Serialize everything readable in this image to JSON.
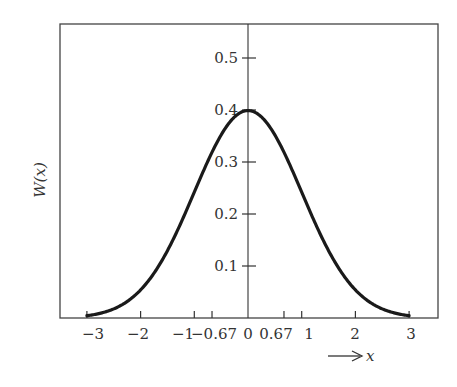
{
  "chart_data": {
    "type": "line",
    "title": "",
    "xlabel": "x",
    "ylabel": "W(x)",
    "xlim": [
      -3.5,
      3.5
    ],
    "ylim": [
      0,
      0.55
    ],
    "grid": false,
    "legend": null,
    "x_ticks": [
      -3,
      -2,
      -1,
      -0.67,
      0,
      0.67,
      1,
      2,
      3
    ],
    "x_tick_labels": [
      "−3",
      "−2",
      "−1",
      "−0.67",
      "0",
      "0.67",
      "1",
      "2",
      "3"
    ],
    "y_ticks": [
      0.1,
      0.2,
      0.3,
      0.4,
      0.5
    ],
    "y_tick_labels": [
      "0.1",
      "0.2",
      "0.3",
      "0.4",
      "0.5"
    ],
    "series": [
      {
        "name": "W(x) standard normal density",
        "x": [
          -3.0,
          -2.5,
          -2.0,
          -1.5,
          -1.0,
          -0.67,
          -0.5,
          0.0,
          0.5,
          0.67,
          1.0,
          1.5,
          2.0,
          2.5,
          3.0
        ],
        "y": [
          0.004,
          0.018,
          0.054,
          0.13,
          0.242,
          0.319,
          0.352,
          0.399,
          0.352,
          0.319,
          0.242,
          0.13,
          0.054,
          0.018,
          0.004
        ]
      }
    ],
    "annotations": [
      "→ x arrow below axis"
    ]
  },
  "labels": {
    "ylabel": "W(x)",
    "xlabel": "x"
  }
}
